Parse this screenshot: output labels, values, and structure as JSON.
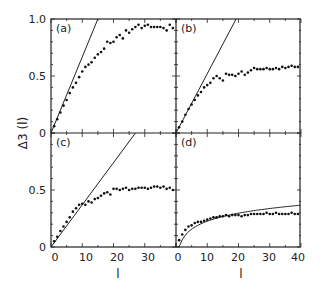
{
  "figure": {
    "ylabel": "Δ3 (l)",
    "xlabel_left": "l",
    "xlabel_right": "l",
    "y_ticks": [
      "0",
      "0.5",
      "1.0"
    ],
    "y_ticks_lower": [
      "0",
      "0.5"
    ],
    "x_ticks_left": [
      "0",
      "10",
      "20",
      "30"
    ],
    "x_ticks_right": [
      "0",
      "10",
      "20",
      "30",
      "40"
    ]
  },
  "chart_data": [
    {
      "type": "scatter",
      "panel": "(a)",
      "xlabel": "l",
      "ylabel": "Δ3(l)",
      "xlim": [
        0,
        40
      ],
      "ylim": [
        0,
        1.0
      ],
      "line": {
        "kind": "linear",
        "slope": 0.0667,
        "label": "l/15"
      },
      "series": [
        {
          "name": "data",
          "x": [
            1,
            2,
            3,
            4,
            5,
            6,
            7,
            8,
            9,
            10,
            11,
            12,
            13,
            14,
            15,
            16,
            17,
            18,
            19,
            20,
            21,
            22,
            23,
            24,
            25,
            26,
            27,
            28,
            29,
            30,
            31,
            32,
            33,
            34,
            35,
            36,
            37,
            38,
            39
          ],
          "y": [
            0.06,
            0.12,
            0.18,
            0.24,
            0.29,
            0.35,
            0.4,
            0.44,
            0.49,
            0.54,
            0.58,
            0.6,
            0.62,
            0.66,
            0.69,
            0.71,
            0.74,
            0.8,
            0.79,
            0.8,
            0.84,
            0.86,
            0.83,
            0.9,
            0.88,
            0.91,
            0.93,
            0.95,
            0.92,
            0.94,
            0.95,
            0.93,
            0.93,
            0.93,
            0.93,
            0.92,
            0.9,
            0.95,
            0.92
          ]
        }
      ]
    },
    {
      "type": "scatter",
      "panel": "(b)",
      "xlabel": "l",
      "ylabel": "Δ3(l)",
      "xlim": [
        0,
        40
      ],
      "ylim": [
        0,
        1.0
      ],
      "line": {
        "kind": "linear",
        "slope": 0.052
      },
      "series": [
        {
          "name": "data",
          "x": [
            1,
            2,
            3,
            4,
            5,
            6,
            7,
            8,
            9,
            10,
            11,
            12,
            13,
            14,
            15,
            16,
            17,
            18,
            19,
            20,
            21,
            22,
            23,
            24,
            25,
            26,
            27,
            28,
            29,
            30,
            31,
            32,
            33,
            34,
            35,
            36,
            37,
            38,
            39
          ],
          "y": [
            0.05,
            0.1,
            0.16,
            0.21,
            0.25,
            0.29,
            0.33,
            0.36,
            0.4,
            0.42,
            0.44,
            0.48,
            0.5,
            0.48,
            0.46,
            0.52,
            0.51,
            0.51,
            0.5,
            0.52,
            0.54,
            0.51,
            0.53,
            0.55,
            0.57,
            0.56,
            0.56,
            0.56,
            0.57,
            0.56,
            0.56,
            0.57,
            0.56,
            0.58,
            0.57,
            0.58,
            0.59,
            0.58,
            0.58
          ]
        }
      ]
    },
    {
      "type": "scatter",
      "panel": "(c)",
      "xlabel": "l",
      "ylabel": "Δ3(l)",
      "xlim": [
        0,
        40
      ],
      "ylim": [
        0,
        1.0
      ],
      "line": {
        "kind": "linear",
        "slope": 0.037
      },
      "series": [
        {
          "name": "data",
          "x": [
            1,
            2,
            3,
            4,
            5,
            6,
            7,
            8,
            9,
            10,
            11,
            12,
            13,
            14,
            15,
            16,
            17,
            18,
            19,
            20,
            21,
            22,
            23,
            24,
            25,
            26,
            27,
            28,
            29,
            30,
            31,
            32,
            33,
            34,
            35,
            36,
            37,
            38,
            39
          ],
          "y": [
            0.05,
            0.09,
            0.14,
            0.18,
            0.22,
            0.26,
            0.31,
            0.34,
            0.37,
            0.38,
            0.37,
            0.4,
            0.39,
            0.42,
            0.43,
            0.45,
            0.47,
            0.48,
            0.46,
            0.51,
            0.51,
            0.5,
            0.51,
            0.52,
            0.5,
            0.51,
            0.51,
            0.52,
            0.52,
            0.52,
            0.51,
            0.52,
            0.53,
            0.53,
            0.52,
            0.53,
            0.51,
            0.52,
            0.5
          ]
        }
      ]
    },
    {
      "type": "scatter",
      "panel": "(d)",
      "xlabel": "l",
      "ylabel": "Δ3(l)",
      "xlim": [
        0,
        40
      ],
      "ylim": [
        0,
        1.0
      ],
      "line": {
        "kind": "log",
        "label": "GOE"
      },
      "series": [
        {
          "name": "data",
          "x": [
            1,
            2,
            3,
            4,
            5,
            6,
            7,
            8,
            9,
            10,
            11,
            12,
            13,
            14,
            15,
            16,
            17,
            18,
            19,
            20,
            21,
            22,
            23,
            24,
            25,
            26,
            27,
            28,
            29,
            30,
            31,
            32,
            33,
            34,
            35,
            36,
            37,
            38,
            39
          ],
          "y": [
            0.06,
            0.11,
            0.15,
            0.18,
            0.19,
            0.21,
            0.22,
            0.22,
            0.23,
            0.24,
            0.25,
            0.26,
            0.26,
            0.27,
            0.27,
            0.28,
            0.27,
            0.28,
            0.28,
            0.28,
            0.27,
            0.28,
            0.28,
            0.29,
            0.29,
            0.29,
            0.29,
            0.29,
            0.3,
            0.29,
            0.29,
            0.3,
            0.29,
            0.29,
            0.29,
            0.29,
            0.3,
            0.29,
            0.29
          ]
        }
      ]
    }
  ]
}
